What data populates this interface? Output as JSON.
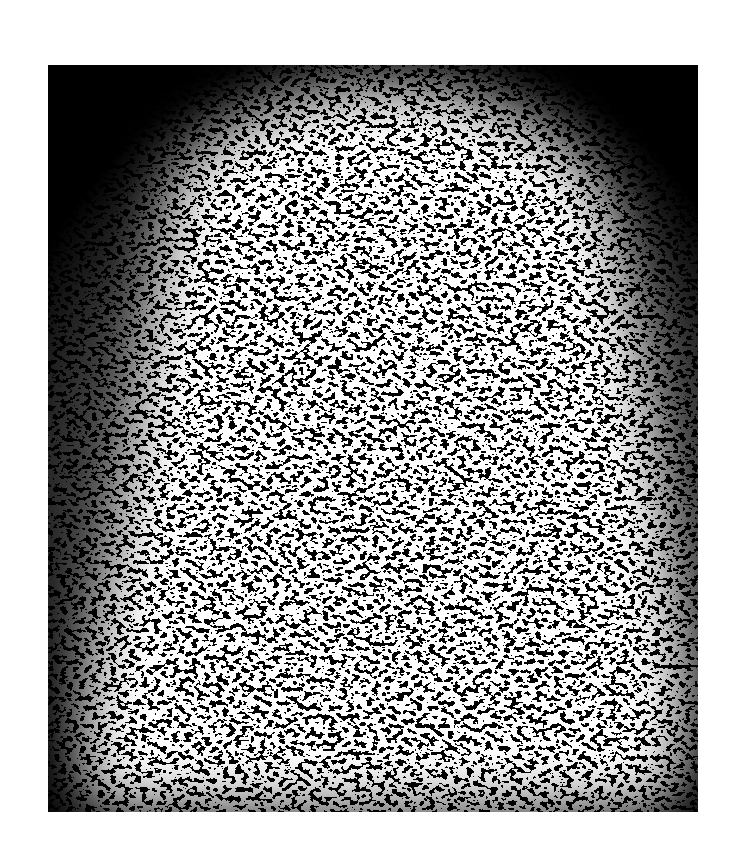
{
  "image": {
    "description": "Binarized high-contrast speckle / noise texture forming a bright dome-shaped blob inside a black rectangular frame",
    "background_color": "#ffffff",
    "frame_color": "#000000",
    "speckle_color": "#ffffff",
    "frame": {
      "x": 48,
      "y": 65,
      "width": 650,
      "height": 747
    }
  }
}
